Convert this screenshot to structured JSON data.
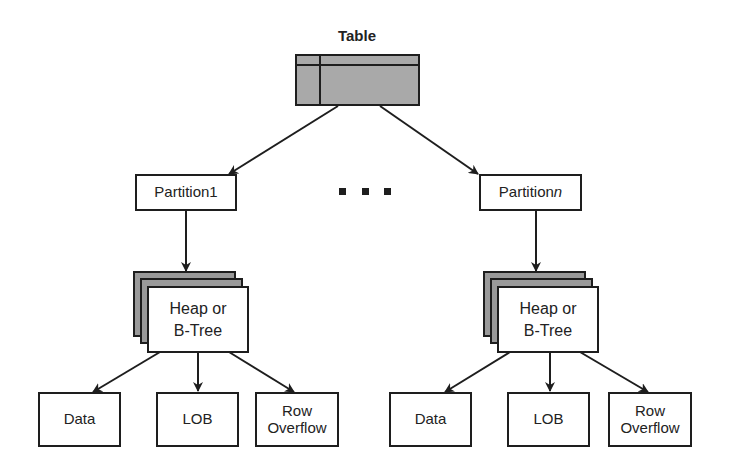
{
  "diagram": {
    "root": {
      "label": "Table"
    },
    "ellipsis": "...",
    "partitions": [
      {
        "label": "Partition1",
        "label_main": "Partition1",
        "label_suffix": "",
        "storage": {
          "line1": "Heap or",
          "line2": "B-Tree"
        },
        "children": [
          {
            "label": "Data"
          },
          {
            "label": "LOB"
          },
          {
            "line1": "Row",
            "line2": "Overflow"
          }
        ]
      },
      {
        "label": "Partitionn",
        "label_main": "Partition",
        "label_suffix": "n",
        "storage": {
          "line1": "Heap or",
          "line2": "B-Tree"
        },
        "children": [
          {
            "label": "Data"
          },
          {
            "label": "LOB"
          },
          {
            "line1": "Row",
            "line2": "Overflow"
          }
        ]
      }
    ],
    "colors": {
      "stroke": "#1e1e1e",
      "table_fill": "#a9a9a9",
      "stack_fill": "#9a9a9a",
      "box_fill": "#ffffff"
    }
  }
}
